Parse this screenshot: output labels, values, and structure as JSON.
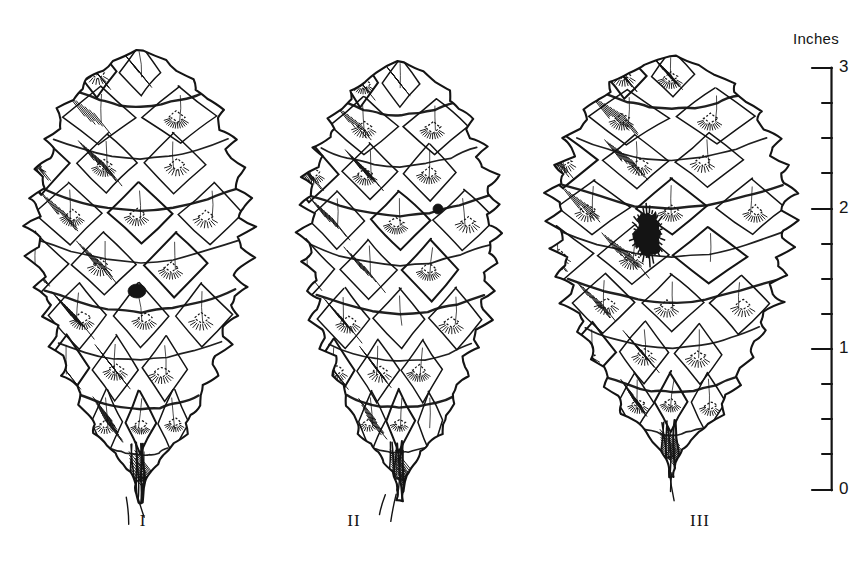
{
  "figure": {
    "kind": "scientific-line-drawing",
    "background_color": "#ffffff",
    "ink_color": "#141414"
  },
  "specimens": [
    {
      "id": "I",
      "label": "I",
      "label_x": 143,
      "label_y": 521,
      "center_x": 140,
      "apex_y": 50,
      "base_y": 503,
      "half_width": 108,
      "umbo": {
        "cx": 137,
        "cy": 291,
        "rx": 9,
        "ry": 7,
        "shape": "round-dot"
      },
      "seed": 11
    },
    {
      "id": "II",
      "label": "II",
      "label_x": 354,
      "label_y": 521,
      "center_x": 400,
      "apex_y": 62,
      "base_y": 500,
      "half_width": 96,
      "umbo": {
        "cx": 438,
        "cy": 209,
        "rx": 5,
        "ry": 5,
        "shape": "small-dot"
      },
      "seed": 29
    },
    {
      "id": "III",
      "label": "III",
      "label_x": 700,
      "label_y": 521,
      "center_x": 672,
      "apex_y": 55,
      "base_y": 478,
      "half_width": 118,
      "umbo": {
        "cx": 648,
        "cy": 234,
        "rx": 13,
        "ry": 22,
        "shape": "large-elongate"
      },
      "seed": 47
    }
  ],
  "scale_bar": {
    "caption": "Inches",
    "caption_x": 793,
    "caption_y": 30,
    "axis_x": 832,
    "top_y": 68,
    "bottom_y": 490,
    "min": 0,
    "max": 3,
    "major_tick_length": 20,
    "minor_tick_length": 10,
    "major_ticks": [
      {
        "value": "3",
        "y": 68
      },
      {
        "value": "2",
        "y": 209
      },
      {
        "value": "1",
        "y": 349
      },
      {
        "value": "0",
        "y": 490
      }
    ],
    "minor_ticks_y": [
      103,
      138,
      173,
      244,
      279,
      314,
      384,
      419,
      454
    ],
    "labels": [
      "3",
      "2",
      "1",
      "0"
    ]
  }
}
